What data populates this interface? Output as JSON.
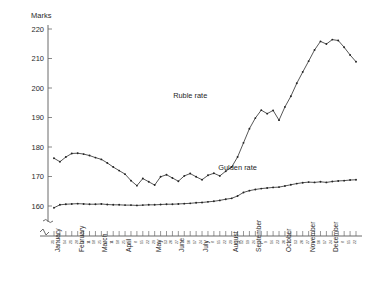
{
  "chart_data": {
    "type": "line",
    "title": "",
    "ylabel": "Marks",
    "xlabel": "",
    "ylim": [
      155,
      222
    ],
    "yticks": [
      160,
      170,
      180,
      190,
      200,
      210,
      220
    ],
    "axis_break": true,
    "grid": false,
    "legend_position": "inline-annotation",
    "x": [
      "31",
      "7",
      "14",
      "21",
      "28",
      "4",
      "11",
      "18",
      "25",
      "4",
      "11",
      "18",
      "25",
      "1",
      "8",
      "15",
      "22",
      "29",
      "6",
      "13",
      "20",
      "27",
      "3",
      "10",
      "17",
      "24",
      "1",
      "8",
      "15",
      "22",
      "29",
      "5",
      "12",
      "19",
      "26",
      "2",
      "9",
      "16",
      "23",
      "30",
      "6",
      "13",
      "20",
      "27",
      "3",
      "10",
      "17",
      "24",
      "1",
      "8",
      "15",
      "22"
    ],
    "months": [
      {
        "label": "January",
        "start_index": 1
      },
      {
        "label": "February",
        "start_index": 5
      },
      {
        "label": "March",
        "start_index": 9
      },
      {
        "label": "April",
        "start_index": 13
      },
      {
        "label": "May",
        "start_index": 18
      },
      {
        "label": "June",
        "start_index": 22
      },
      {
        "label": "July",
        "start_index": 26
      },
      {
        "label": "August",
        "start_index": 31
      },
      {
        "label": "September",
        "start_index": 35
      },
      {
        "label": "October",
        "start_index": 40
      },
      {
        "label": "November",
        "start_index": 44
      },
      {
        "label": "December",
        "start_index": 48
      }
    ],
    "series": [
      {
        "name": "Ruble rate",
        "label_x_index": 23,
        "label_value": 196.5,
        "values": [
          176.2,
          175.0,
          176.6,
          177.8,
          177.9,
          177.6,
          177.1,
          176.4,
          175.8,
          174.6,
          173.2,
          172.0,
          170.8,
          168.6,
          166.9,
          169.3,
          168.2,
          167.1,
          169.9,
          170.6,
          169.5,
          168.4,
          170.2,
          171.0,
          169.9,
          168.9,
          170.4,
          171.1,
          170.2,
          171.8,
          173.2,
          176.6,
          181.4,
          186.2,
          189.8,
          192.5,
          191.3,
          192.4,
          189.1,
          193.6,
          197.2,
          201.6,
          205.4,
          209.1,
          212.9,
          215.8,
          214.9,
          216.4,
          216.1,
          213.8,
          211.2,
          208.9
        ]
      },
      {
        "name": "Gulden rate",
        "label_x_index": 31,
        "label_value": 172.1,
        "values": [
          159.4,
          160.4,
          160.6,
          160.7,
          160.8,
          160.7,
          160.6,
          160.6,
          160.7,
          160.5,
          160.4,
          160.4,
          160.3,
          160.3,
          160.2,
          160.3,
          160.4,
          160.4,
          160.5,
          160.6,
          160.6,
          160.7,
          160.8,
          160.9,
          161.1,
          161.2,
          161.4,
          161.6,
          161.9,
          162.3,
          162.6,
          163.4,
          164.6,
          165.2,
          165.6,
          165.9,
          166.1,
          166.3,
          166.4,
          166.8,
          167.2,
          167.6,
          167.9,
          168.1,
          168.0,
          168.2,
          168.0,
          168.3,
          168.5,
          168.6,
          168.8,
          168.9
        ]
      }
    ]
  }
}
